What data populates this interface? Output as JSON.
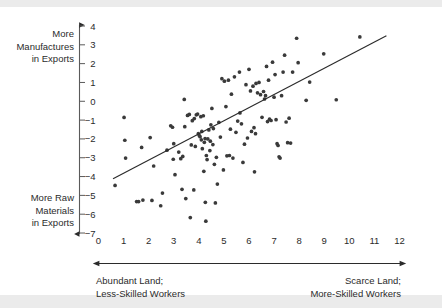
{
  "figure": {
    "background": "#ffffff",
    "band_color": "#ebebeb",
    "ink_color": "#2b2b2b",
    "point_color": "#3a3a3a"
  },
  "annotations": {
    "y_top_label": "More\nManufactures\nin Exports",
    "y_top_lines": [
      "More",
      "Manufactures",
      "in Exports"
    ],
    "y_bottom_lines": [
      "More Raw",
      "Materials",
      "in Exports"
    ],
    "x_left_lines": [
      "Abundant Land;",
      "Less-Skilled Workers"
    ],
    "x_right_lines": [
      "Scarce Land;",
      "More-Skilled Workers"
    ]
  },
  "chart_data": {
    "type": "scatter",
    "title": "",
    "xlabel": "",
    "ylabel": "",
    "xlim": [
      0,
      12
    ],
    "ylim": [
      -7,
      4
    ],
    "xticks": [
      0,
      1,
      2,
      3,
      4,
      5,
      6,
      7,
      8,
      9,
      10,
      11,
      12
    ],
    "xtick_labels": [
      "0",
      "1",
      "2",
      "3",
      "4",
      "5",
      "6",
      "7",
      "8",
      "9",
      "10",
      "11",
      "12"
    ],
    "yticks": [
      4,
      3,
      2,
      1,
      0,
      -1,
      -2,
      -3,
      -4,
      -5,
      -6,
      -7
    ],
    "ytick_labels": [
      "4",
      "3",
      "2",
      "1",
      "0",
      "−1",
      "−2",
      "−3",
      "−4",
      "−5",
      "−6",
      "−7"
    ],
    "grid": false,
    "legend": null,
    "axis_style": "arrow-left-spine",
    "trendline": {
      "type": "linear",
      "x0": 0.58,
      "y0": -4.12,
      "x1": 11.48,
      "y1": 3.48
    },
    "points": [
      [
        0.66,
        -4.47
      ],
      [
        1.02,
        -0.86
      ],
      [
        1.05,
        -2.07
      ],
      [
        1.08,
        -3.02
      ],
      [
        1.52,
        -5.33
      ],
      [
        1.6,
        -5.33
      ],
      [
        1.72,
        -2.45
      ],
      [
        1.77,
        -5.25
      ],
      [
        2.06,
        -1.93
      ],
      [
        2.13,
        -5.27
      ],
      [
        2.2,
        -3.44
      ],
      [
        2.48,
        -5.55
      ],
      [
        2.55,
        -4.88
      ],
      [
        2.73,
        -2.6
      ],
      [
        2.88,
        -1.3
      ],
      [
        2.95,
        -1.38
      ],
      [
        3.0,
        -2.25
      ],
      [
        3.05,
        -3.9
      ],
      [
        3.2,
        -2.7
      ],
      [
        3.28,
        -3.05
      ],
      [
        3.33,
        -4.68
      ],
      [
        3.36,
        -2.93
      ],
      [
        3.42,
        0.1
      ],
      [
        3.48,
        -5.17
      ],
      [
        3.55,
        -0.75
      ],
      [
        3.62,
        -0.7
      ],
      [
        3.66,
        -6.18
      ],
      [
        3.7,
        -2.32
      ],
      [
        3.74,
        -1.03
      ],
      [
        3.8,
        -4.71
      ],
      [
        3.82,
        -0.92
      ],
      [
        3.86,
        -2.4
      ],
      [
        3.9,
        -0.72
      ],
      [
        3.95,
        -0.68
      ],
      [
        3.98,
        -1.72
      ],
      [
        4.02,
        -1.83
      ],
      [
        4.05,
        -1.88
      ],
      [
        4.08,
        -0.82
      ],
      [
        4.1,
        -2.05
      ],
      [
        4.12,
        -1.6
      ],
      [
        4.14,
        -2.52
      ],
      [
        4.18,
        -0.77
      ],
      [
        4.2,
        -3.72
      ],
      [
        4.22,
        -2.18
      ],
      [
        4.25,
        -1.98
      ],
      [
        4.26,
        -5.37
      ],
      [
        4.28,
        -6.37
      ],
      [
        4.3,
        -2.88
      ],
      [
        4.33,
        -3.1
      ],
      [
        4.36,
        -2.0
      ],
      [
        4.4,
        -1.52
      ],
      [
        4.44,
        -2.62
      ],
      [
        4.48,
        -1.25
      ],
      [
        4.52,
        -0.38
      ],
      [
        4.58,
        -1.45
      ],
      [
        4.62,
        -3.35
      ],
      [
        4.66,
        -5.4
      ],
      [
        4.7,
        -2.98
      ],
      [
        4.74,
        -4.4
      ],
      [
        4.8,
        -1.12
      ],
      [
        4.86,
        -1.9
      ],
      [
        4.92,
        1.2
      ],
      [
        4.98,
        -3.65
      ],
      [
        5.02,
        1.07
      ],
      [
        5.08,
        -0.28
      ],
      [
        5.12,
        -2.9
      ],
      [
        5.18,
        1.12
      ],
      [
        5.22,
        -2.88
      ],
      [
        5.26,
        -1.48
      ],
      [
        5.3,
        0.38
      ],
      [
        5.36,
        -3.02
      ],
      [
        5.42,
        1.3
      ],
      [
        5.48,
        -1.65
      ],
      [
        5.55,
        -1.05
      ],
      [
        5.62,
        1.55
      ],
      [
        5.7,
        -1.2
      ],
      [
        5.76,
        -3.25
      ],
      [
        5.82,
        -2.28
      ],
      [
        5.88,
        0.88
      ],
      [
        5.94,
        -1.95
      ],
      [
        6.0,
        1.7
      ],
      [
        6.06,
        0.55
      ],
      [
        6.1,
        -1.6
      ],
      [
        6.16,
        0.8
      ],
      [
        6.22,
        -3.75
      ],
      [
        6.28,
        0.95
      ],
      [
        6.34,
        0.45
      ],
      [
        6.4,
        1.0
      ],
      [
        6.46,
        0.35
      ],
      [
        6.52,
        -0.85
      ],
      [
        6.58,
        0.52
      ],
      [
        6.62,
        0.12
      ],
      [
        6.66,
        0.3
      ],
      [
        6.7,
        1.85
      ],
      [
        6.74,
        -1.08
      ],
      [
        6.78,
        1.12
      ],
      [
        6.82,
        -0.95
      ],
      [
        6.88,
        -1.02
      ],
      [
        6.94,
        2.08
      ],
      [
        7.0,
        0.22
      ],
      [
        7.04,
        1.42
      ],
      [
        7.08,
        -0.98
      ],
      [
        7.12,
        -2.25
      ],
      [
        7.16,
        -2.35
      ],
      [
        7.2,
        -2.95
      ],
      [
        7.24,
        -3.02
      ],
      [
        7.3,
        0.3
      ],
      [
        7.36,
        1.55
      ],
      [
        7.42,
        2.45
      ],
      [
        7.48,
        -1.1
      ],
      [
        7.54,
        -2.2
      ],
      [
        7.6,
        -0.9
      ],
      [
        7.66,
        -2.22
      ],
      [
        7.74,
        1.55
      ],
      [
        7.9,
        3.35
      ],
      [
        7.96,
        2.05
      ],
      [
        8.28,
        0.05
      ],
      [
        8.42,
        1.02
      ],
      [
        8.98,
        2.52
      ],
      [
        9.48,
        0.08
      ],
      [
        10.42,
        3.42
      ],
      [
        4.46,
        -2.12
      ],
      [
        4.56,
        -2.3
      ],
      [
        5.64,
        -0.62
      ],
      [
        6.2,
        -1.4
      ],
      [
        6.26,
        -1.72
      ],
      [
        3.44,
        -1.35
      ],
      [
        2.98,
        -3.08
      ]
    ]
  }
}
